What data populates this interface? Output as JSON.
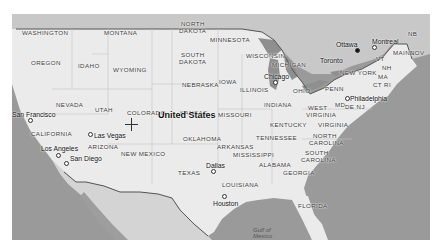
{
  "map": {
    "country_label": "United States",
    "center_marker": "crosshair",
    "colors": {
      "land_us": "#e9e9e9",
      "land_other": "#c9c9c9",
      "water": "#9a9a9a",
      "border": "#555555"
    },
    "states": [
      {
        "label": "WASHINGTON",
        "x": 22,
        "y": 30
      },
      {
        "label": "MONTANA",
        "x": 104,
        "y": 30
      },
      {
        "label": "NORTH",
        "x": 181,
        "y": 21
      },
      {
        "label": "DAKOTA",
        "x": 179,
        "y": 28
      },
      {
        "label": "MINNESOTA",
        "x": 210,
        "y": 37
      },
      {
        "label": "OREGON",
        "x": 31,
        "y": 60
      },
      {
        "label": "IDAHO",
        "x": 78,
        "y": 63
      },
      {
        "label": "WYOMING",
        "x": 113,
        "y": 67
      },
      {
        "label": "SOUTH",
        "x": 181,
        "y": 52
      },
      {
        "label": "DAKOTA",
        "x": 179,
        "y": 59
      },
      {
        "label": "WISCONSIN",
        "x": 246,
        "y": 53
      },
      {
        "label": "MICHIGAN",
        "x": 272,
        "y": 62
      },
      {
        "label": "NEBRASKA",
        "x": 182,
        "y": 82
      },
      {
        "label": "IOWA",
        "x": 219,
        "y": 79
      },
      {
        "label": "ILLINOIS",
        "x": 240,
        "y": 87
      },
      {
        "label": "INDIANA",
        "x": 264,
        "y": 102
      },
      {
        "label": "OHIO",
        "x": 293,
        "y": 88
      },
      {
        "label": "PENN",
        "x": 325,
        "y": 86
      },
      {
        "label": "NEW YORK",
        "x": 340,
        "y": 70
      },
      {
        "label": "VT",
        "x": 376,
        "y": 56
      },
      {
        "label": "NH",
        "x": 382,
        "y": 65
      },
      {
        "label": "MA",
        "x": 378,
        "y": 74
      },
      {
        "label": "CT RI",
        "x": 373,
        "y": 82
      },
      {
        "label": "MAINE",
        "x": 393,
        "y": 50
      },
      {
        "label": "NB",
        "x": 408,
        "y": 31
      },
      {
        "label": "NOV",
        "x": 410,
        "y": 50
      },
      {
        "label": "MD",
        "x": 335,
        "y": 102
      },
      {
        "label": "DE NJ",
        "x": 345,
        "y": 104
      },
      {
        "label": "NEVADA",
        "x": 56,
        "y": 102
      },
      {
        "label": "UTAH",
        "x": 95,
        "y": 107
      },
      {
        "label": "COLORADO",
        "x": 127,
        "y": 110
      },
      {
        "label": "KANSAS",
        "x": 180,
        "y": 110
      },
      {
        "label": "MISSOURI",
        "x": 218,
        "y": 112
      },
      {
        "label": "WEST",
        "x": 308,
        "y": 105
      },
      {
        "label": "VIRGINIA",
        "x": 306,
        "y": 112
      },
      {
        "label": "KENTUCKY",
        "x": 270,
        "y": 122
      },
      {
        "label": "VIRGINIA",
        "x": 318,
        "y": 122
      },
      {
        "label": "CALIFORNIA",
        "x": 31,
        "y": 131
      },
      {
        "label": "ARIZONA",
        "x": 88,
        "y": 144
      },
      {
        "label": "NEW MEXICO",
        "x": 121,
        "y": 151
      },
      {
        "label": "OKLAHOMA",
        "x": 183,
        "y": 136
      },
      {
        "label": "TENNESSEE",
        "x": 256,
        "y": 135
      },
      {
        "label": "NORTH",
        "x": 313,
        "y": 133
      },
      {
        "label": "CAROLINA",
        "x": 309,
        "y": 140
      },
      {
        "label": "ARKANSAS",
        "x": 217,
        "y": 144
      },
      {
        "label": "MISSISSIPPI",
        "x": 233,
        "y": 152
      },
      {
        "label": "ALABAMA",
        "x": 259,
        "y": 162
      },
      {
        "label": "SOUTH",
        "x": 305,
        "y": 150
      },
      {
        "label": "CAROLINA",
        "x": 301,
        "y": 157
      },
      {
        "label": "TEXAS",
        "x": 178,
        "y": 170
      },
      {
        "label": "GEORGIA",
        "x": 283,
        "y": 170
      },
      {
        "label": "LOUISIANA",
        "x": 222,
        "y": 182
      },
      {
        "label": "FLORIDA",
        "x": 298,
        "y": 203
      }
    ],
    "cities": [
      {
        "label": "Ottawa",
        "x": 336,
        "y": 42,
        "dot_x": 357,
        "dot_y": 50,
        "filled": true
      },
      {
        "label": "Montreal",
        "x": 372,
        "y": 39,
        "dot_x": 374,
        "dot_y": 47
      },
      {
        "label": "Toronto",
        "x": 320,
        "y": 58,
        "dot_x": 0,
        "dot_y": 0,
        "nodot": true
      },
      {
        "label": "Chicago",
        "x": 264,
        "y": 74,
        "dot_x": 275,
        "dot_y": 82
      },
      {
        "label": "Philadelphia",
        "x": 350,
        "y": 96,
        "dot_x": 347,
        "dot_y": 98
      },
      {
        "label": "San Francisco",
        "x": 12,
        "y": 112,
        "dot_x": 30,
        "dot_y": 120
      },
      {
        "label": "Las Vegas",
        "x": 94,
        "y": 133,
        "dot_x": 90,
        "dot_y": 134
      },
      {
        "label": "Los Angeles",
        "x": 41,
        "y": 146,
        "dot_x": 58,
        "dot_y": 155
      },
      {
        "label": "San Diego",
        "x": 70,
        "y": 156,
        "dot_x": 66,
        "dot_y": 163
      },
      {
        "label": "Dallas",
        "x": 206,
        "y": 163,
        "dot_x": 213,
        "dot_y": 171
      },
      {
        "label": "Houston",
        "x": 213,
        "y": 201,
        "dot_x": 224,
        "dot_y": 196
      }
    ],
    "water_labels": [
      {
        "label": "Gulf of",
        "x": 253,
        "y": 227
      },
      {
        "label": "Mexico",
        "x": 253,
        "y": 233
      }
    ],
    "crosshair": {
      "x": 119,
      "y": 104
    }
  }
}
